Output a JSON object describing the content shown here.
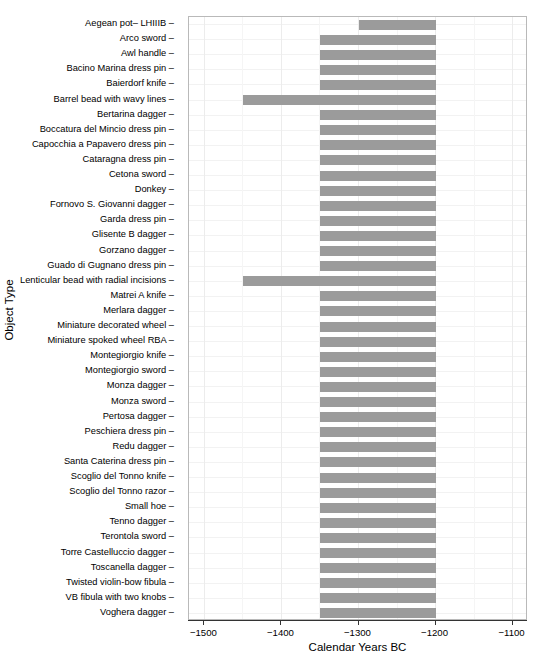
{
  "chart_data": {
    "type": "bar",
    "orientation": "horizontal",
    "title": "",
    "xlabel": "Calendar Years BC",
    "ylabel": "Object Type",
    "xlim": [
      -1520,
      -1080
    ],
    "ylim_categories": 40,
    "grid": true,
    "legend": false,
    "x_ticks": [
      -1500,
      -1400,
      -1300,
      -1200,
      -1100
    ],
    "x_tick_labels": [
      "−1500",
      "−1400",
      "−1300",
      "−1200",
      "−1100"
    ],
    "bar_color": "#9b9b9b",
    "categories": [
      "Aegean pot– LHIIIB",
      "Arco sword",
      "Awl handle",
      "Bacino Marina dress pin",
      "Baierdorf knife",
      "Barrel bead with wavy lines",
      "Bertarina dagger",
      "Boccatura del Mincio dress pin",
      "Capocchia a Papavero dress pin",
      "Cataragna dress pin",
      "Cetona sword",
      "Donkey",
      "Fornovo S. Giovanni dagger",
      "Garda dress pin",
      "Glisente B dagger",
      "Gorzano dagger",
      "Guado di Gugnano dress pin",
      "Lenticular bead with radial incisions",
      "Matrei A knife",
      "Merlara dagger",
      "Miniature decorated wheel",
      "Miniature spoked wheel RBA",
      "Montegiorgio knife",
      "Montegiorgio sword",
      "Monza dagger",
      "Monza sword",
      "Pertosa dagger",
      "Peschiera dress pin",
      "Redu dagger",
      "Santa Caterina dress pin",
      "Scoglio del Tonno knife",
      "Scoglio del Tonno razor",
      "Small hoe",
      "Tenno dagger",
      "Terontola sword",
      "Torre Castelluccio dagger",
      "Toscanella dagger",
      "Twisted violin-bow fibula",
      "VB fibula with two knobs",
      "Voghera dagger"
    ],
    "ranges": [
      {
        "category": "Aegean pot– LHIIIB",
        "start": -1300,
        "end": -1200
      },
      {
        "category": "Arco sword",
        "start": -1350,
        "end": -1200
      },
      {
        "category": "Awl handle",
        "start": -1350,
        "end": -1200
      },
      {
        "category": "Bacino Marina dress pin",
        "start": -1350,
        "end": -1200
      },
      {
        "category": "Baierdorf knife",
        "start": -1350,
        "end": -1200
      },
      {
        "category": "Barrel bead with wavy lines",
        "start": -1450,
        "end": -1200
      },
      {
        "category": "Bertarina dagger",
        "start": -1350,
        "end": -1200
      },
      {
        "category": "Boccatura del Mincio dress pin",
        "start": -1350,
        "end": -1200
      },
      {
        "category": "Capocchia a Papavero dress pin",
        "start": -1350,
        "end": -1200
      },
      {
        "category": "Cataragna dress pin",
        "start": -1350,
        "end": -1200
      },
      {
        "category": "Cetona sword",
        "start": -1350,
        "end": -1200
      },
      {
        "category": "Donkey",
        "start": -1350,
        "end": -1200
      },
      {
        "category": "Fornovo S. Giovanni dagger",
        "start": -1350,
        "end": -1200
      },
      {
        "category": "Garda dress pin",
        "start": -1350,
        "end": -1200
      },
      {
        "category": "Glisente B dagger",
        "start": -1350,
        "end": -1200
      },
      {
        "category": "Gorzano dagger",
        "start": -1350,
        "end": -1200
      },
      {
        "category": "Guado di Gugnano dress pin",
        "start": -1350,
        "end": -1200
      },
      {
        "category": "Lenticular bead with radial incisions",
        "start": -1450,
        "end": -1200
      },
      {
        "category": "Matrei A knife",
        "start": -1350,
        "end": -1200
      },
      {
        "category": "Merlara dagger",
        "start": -1350,
        "end": -1200
      },
      {
        "category": "Miniature decorated wheel",
        "start": -1350,
        "end": -1200
      },
      {
        "category": "Miniature spoked wheel RBA",
        "start": -1350,
        "end": -1200
      },
      {
        "category": "Montegiorgio knife",
        "start": -1350,
        "end": -1200
      },
      {
        "category": "Montegiorgio sword",
        "start": -1350,
        "end": -1200
      },
      {
        "category": "Monza dagger",
        "start": -1350,
        "end": -1200
      },
      {
        "category": "Monza sword",
        "start": -1350,
        "end": -1200
      },
      {
        "category": "Pertosa dagger",
        "start": -1350,
        "end": -1200
      },
      {
        "category": "Peschiera dress pin",
        "start": -1350,
        "end": -1200
      },
      {
        "category": "Redu dagger",
        "start": -1350,
        "end": -1200
      },
      {
        "category": "Santa Caterina dress pin",
        "start": -1350,
        "end": -1200
      },
      {
        "category": "Scoglio del Tonno knife",
        "start": -1350,
        "end": -1200
      },
      {
        "category": "Scoglio del Tonno razor",
        "start": -1350,
        "end": -1200
      },
      {
        "category": "Small hoe",
        "start": -1350,
        "end": -1200
      },
      {
        "category": "Tenno dagger",
        "start": -1350,
        "end": -1200
      },
      {
        "category": "Terontola sword",
        "start": -1350,
        "end": -1200
      },
      {
        "category": "Torre Castelluccio dagger",
        "start": -1350,
        "end": -1200
      },
      {
        "category": "Toscanella dagger",
        "start": -1350,
        "end": -1200
      },
      {
        "category": "Twisted violin-bow fibula",
        "start": -1350,
        "end": -1200
      },
      {
        "category": "VB fibula with two knobs",
        "start": -1350,
        "end": -1200
      },
      {
        "category": "Voghera dagger",
        "start": -1350,
        "end": -1200
      }
    ]
  }
}
